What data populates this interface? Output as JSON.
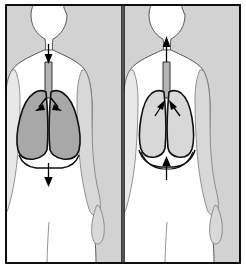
{
  "figure": {
    "type": "anatomical-diagram",
    "subject": "Mechanics of breathing: inhalation and exhalation",
    "panel_count": 2,
    "caption": "",
    "width": 246,
    "height": 268
  },
  "colors": {
    "background": "#d2d2d2",
    "frame_border": "#000000",
    "divider": "#555555",
    "body_fill": "#ffffff",
    "body_outline": "#4a4a4a",
    "lung_outline": "#111111",
    "lung_fill_inhale": "#a8a8a8",
    "lung_fill_exhale": "#d8d8d8",
    "trachea_fill": "#b4b4b4",
    "trachea_outline": "#222222",
    "arrow": "#000000",
    "diaphragm_line": "#111111",
    "limb_shadow": "#d8d8d8"
  },
  "panels": [
    {
      "id": "inhalation",
      "label": "Inhalation",
      "lung_state": "expanded",
      "lung_shade": "dark",
      "diaphragm_state": "flattened",
      "diaphragm_direction": "down",
      "airflow_direction": "in",
      "arrows": [
        {
          "name": "trachea-airflow-arrow",
          "direction": "down",
          "meaning": "air moves in through trachea"
        },
        {
          "name": "bronchus-airflow-arrow-left",
          "direction": "down-left",
          "meaning": "air enters left lung"
        },
        {
          "name": "bronchus-airflow-arrow-right",
          "direction": "down-right",
          "meaning": "air enters right lung"
        },
        {
          "name": "diaphragm-arrow",
          "direction": "down",
          "meaning": "diaphragm contracts and moves down"
        }
      ]
    },
    {
      "id": "exhalation",
      "label": "Exhalation",
      "lung_state": "contracted",
      "lung_shade": "light",
      "diaphragm_state": "domed",
      "diaphragm_direction": "up",
      "airflow_direction": "out",
      "arrows": [
        {
          "name": "trachea-airflow-arrow",
          "direction": "up",
          "meaning": "air moves out through trachea"
        },
        {
          "name": "bronchus-airflow-arrow-left",
          "direction": "up-right",
          "meaning": "air leaves left lung"
        },
        {
          "name": "bronchus-airflow-arrow-right",
          "direction": "up-left",
          "meaning": "air leaves right lung"
        },
        {
          "name": "diaphragm-arrow",
          "direction": "up",
          "meaning": "diaphragm relaxes and moves up"
        }
      ]
    }
  ]
}
